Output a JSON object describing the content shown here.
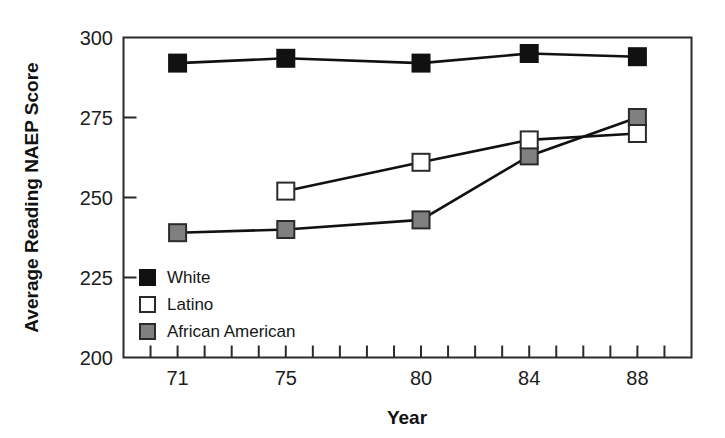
{
  "chart_data": {
    "type": "line",
    "title": "",
    "xlabel": "Year",
    "ylabel": "Average Reading NAEP Score",
    "x": [
      71,
      75,
      80,
      84,
      88
    ],
    "categories": [
      "71",
      "75",
      "80",
      "84",
      "88"
    ],
    "xlim": [
      69,
      90
    ],
    "ylim": [
      200,
      300
    ],
    "yticks": [
      200,
      225,
      250,
      275,
      300
    ],
    "ytick_labels": [
      "200",
      "225",
      "250",
      "275",
      "300"
    ],
    "xtick_labels": [
      "71",
      "75",
      "80",
      "84",
      "88"
    ],
    "xticks_minor_every": 1,
    "grid": false,
    "legend_position": "lower-left-inside",
    "series": [
      {
        "name": "White",
        "marker": "filled-square",
        "color": "#111111",
        "fill": "#111111",
        "x": [
          71,
          75,
          80,
          84,
          88
        ],
        "values": [
          292,
          293.5,
          292,
          295,
          294
        ]
      },
      {
        "name": "Latino",
        "marker": "open-square",
        "color": "#111111",
        "fill": "#ffffff",
        "x": [
          75,
          80,
          84,
          88
        ],
        "values": [
          252,
          261,
          268,
          270
        ]
      },
      {
        "name": "African American",
        "marker": "gray-square",
        "color": "#111111",
        "fill": "#808080",
        "x": [
          71,
          75,
          80,
          84,
          88
        ],
        "values": [
          239,
          240,
          243,
          263,
          275
        ]
      }
    ]
  },
  "legend": {
    "items": [
      {
        "label": "White",
        "swatch": "filled-square"
      },
      {
        "label": "Latino",
        "swatch": "open-square"
      },
      {
        "label": "African American",
        "swatch": "gray-square"
      }
    ]
  },
  "axes": {
    "y_title": "Average Reading NAEP Score",
    "x_title": "Year"
  },
  "colors": {
    "white_series": "#111111",
    "latino_series": "#ffffff",
    "african_american_series": "#808080",
    "axis": "#2b2b2b",
    "background": "#ffffff"
  }
}
